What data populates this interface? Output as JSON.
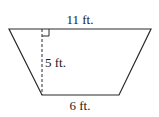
{
  "figure": {
    "shape": "trapezoid",
    "stroke_color": "#2a2a2a",
    "top_base": {
      "label": "11 ft.",
      "value": 11,
      "unit": "ft"
    },
    "bottom_base": {
      "label": "6 ft.",
      "value": 6,
      "unit": "ft"
    },
    "height": {
      "label": "5 ft.",
      "value": 5,
      "unit": "ft",
      "style": "dashed",
      "right_angle_marker": true
    }
  }
}
